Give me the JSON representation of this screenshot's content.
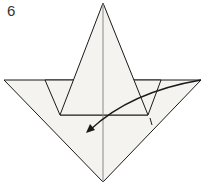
{
  "step": {
    "number": "6"
  },
  "diagram": {
    "type": "origami-fold-step",
    "colors": {
      "paper": "#f4f3ef",
      "line": "#1a1a1a",
      "center_crease": "#8a8a8a",
      "arrow": "#1a1a1a"
    },
    "arrow_direction": "fold right flap down-left"
  }
}
